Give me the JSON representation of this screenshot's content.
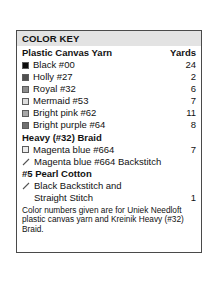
{
  "key": {
    "title": "COLOR KEY",
    "columns": {
      "name": "Plastic Canvas Yarn",
      "yards": "Yards"
    },
    "yarn_rows": [
      {
        "swatch": "swatch-black",
        "color": "#0d0d0d",
        "label": "Black #00",
        "yards": "24"
      },
      {
        "swatch": "swatch-holly",
        "color": "#4f4f4f",
        "label": "Holly #27",
        "yards": "2"
      },
      {
        "swatch": "swatch-royal",
        "color": "#8c8c8c",
        "label": "Royal #32",
        "yards": "6"
      },
      {
        "swatch": "swatch-mermaid",
        "color": "#dcdcdc",
        "label": "Mermaid #53",
        "yards": "7"
      },
      {
        "swatch": "swatch-bright-pink",
        "color": "#a8a8a8",
        "label": "Bright pink #62",
        "yards": "11"
      },
      {
        "swatch": "swatch-bright-purple",
        "color": "#707070",
        "label": "Bright purple #64",
        "yards": "8"
      }
    ],
    "braid_section": {
      "heading": "Heavy (#32) Braid",
      "rows": [
        {
          "kind": "swatch",
          "swatch": "swatch-magenta-blue",
          "color": "#ececec",
          "label": "Magenta blue #664",
          "yards": "7"
        },
        {
          "kind": "stitch",
          "icon": "backstitch-icon",
          "label": "Magenta blue #664 Backstitch",
          "yards": ""
        }
      ]
    },
    "pearl_section": {
      "heading": "#5 Pearl Cotton",
      "rows": [
        {
          "kind": "stitch",
          "icon": "backstitch-icon",
          "label": "Black Backstitch and",
          "yards": ""
        },
        {
          "kind": "continued",
          "label": "Straight Stitch",
          "yards": "1"
        }
      ]
    },
    "footnote": "Color numbers given are for Uniek Needloft plastic canvas yarn and Kreinik Heavy (#32) Braid."
  }
}
